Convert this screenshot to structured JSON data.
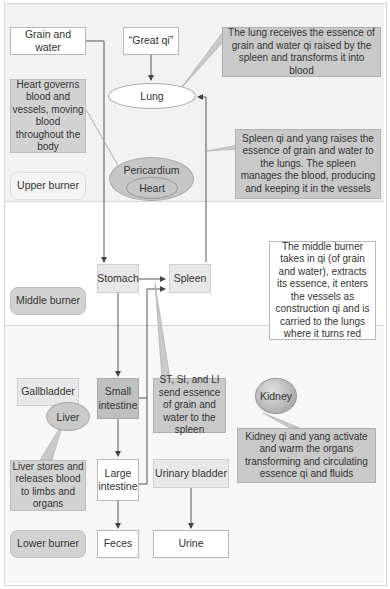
{
  "zones": {
    "upper_label": "Upper burner",
    "middle_label": "Middle burner",
    "lower_label": "Lower burner"
  },
  "upper": {
    "grain_water": "Grain and water",
    "great_qi": "“Great qi”",
    "lung": "Lung",
    "heart_note": "Heart governs blood and vessels, moving blood throughout the body",
    "lung_note": "The lung receives the essence of grain and water qi raised by the spleen and transforms it into blood",
    "spleen_note": "Spleen qi and yang raises the essence of grain and water to the lungs. The spleen manages the blood, producing and keeping it in the vessels",
    "pericardium": "Pericardium",
    "heart": "Heart"
  },
  "middle": {
    "stomach": "Stomach",
    "spleen": "Spleen",
    "middle_note": "The middle burner takes in qi (of grain and water), extracts its essence, it enters the vessels as construction qi and is carried to the lungs where it turns red"
  },
  "lower": {
    "gallbladder": "Gallbladder",
    "liver": "Liver",
    "small_intestine": "Small intestine",
    "st_si_li_note": "ST, SI, and LI send essence of grain and water to the spleen",
    "kidney": "Kidney",
    "kidney_note": "Kidney qi and yang activate and warm the organs transforming and circulating essence qi and fluids",
    "liver_note": "Liver stores and releases blood to limbs and organs",
    "large_intestine": "Large intestine",
    "urinary_bladder": "Urinary bladder",
    "feces": "Feces",
    "urine": "Urine"
  },
  "colors": {
    "upper_bg": "#f2f2f2",
    "middle_bg": "#ffffff",
    "lower_bg": "#f7f7f7",
    "note_fill": "#c9c9c9",
    "line": "#555555"
  }
}
